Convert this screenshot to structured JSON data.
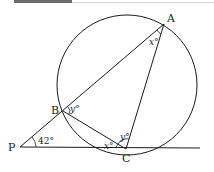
{
  "diagram": {
    "points": [
      {
        "name": "A",
        "x": 164,
        "y": 24
      },
      {
        "name": "B",
        "x": 63,
        "y": 111
      },
      {
        "name": "C",
        "x": 126,
        "y": 149
      },
      {
        "name": "P",
        "x": 20,
        "y": 147
      }
    ],
    "labels": {
      "A": "A",
      "B": "B",
      "C": "C",
      "P": "P"
    },
    "angles": {
      "angle_P": "42°",
      "angle_A": "x°",
      "angle_B": "y°",
      "angle_C_inner": "y°",
      "angle_C_tangent": "x°"
    },
    "circle": {
      "cx": 127,
      "cy": 85,
      "r": 70
    },
    "stroke_color": "#1a1a1a"
  }
}
